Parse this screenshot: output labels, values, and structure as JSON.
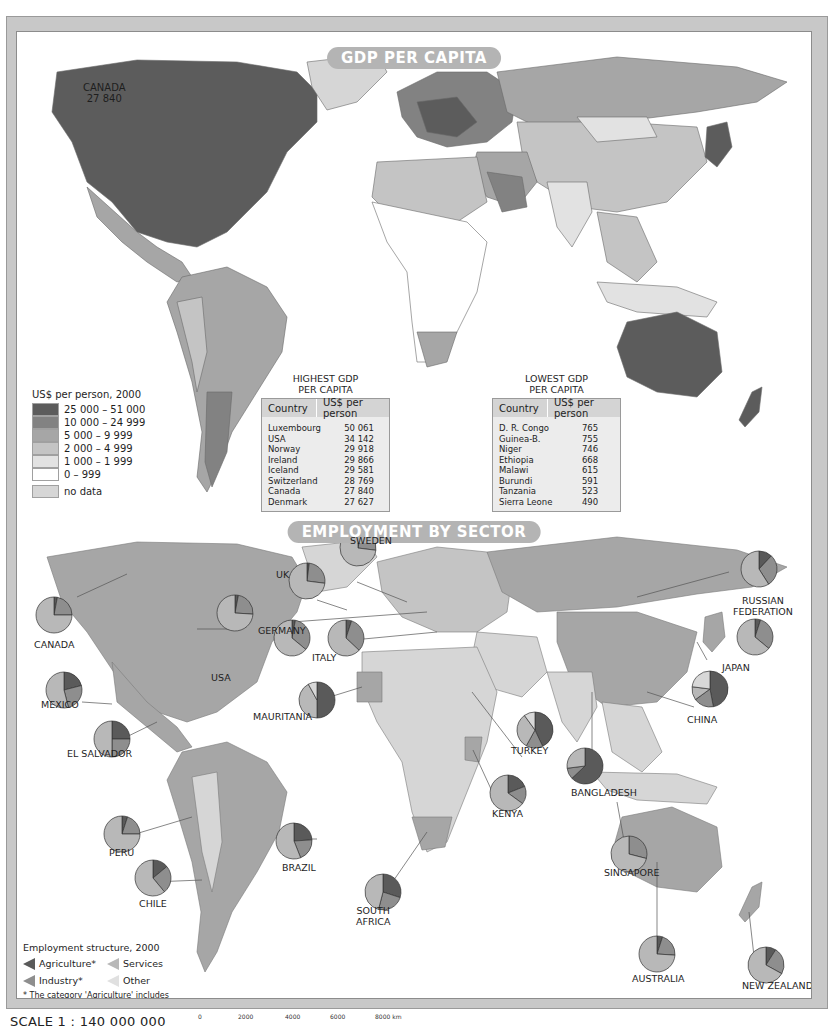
{
  "gdp_map": {
    "title": "GDP PER CAPITA",
    "callout": {
      "country": "CANADA",
      "value": "27 840"
    },
    "legend": {
      "title": "US$ per person, 2000",
      "classes": [
        {
          "label": "25 000 – 51 000",
          "color": "#5c5c5c"
        },
        {
          "label": "10 000 – 24 999",
          "color": "#828282"
        },
        {
          "label": "5 000 – 9 999",
          "color": "#a6a6a6"
        },
        {
          "label": "2 000 – 4 999",
          "color": "#c4c4c4"
        },
        {
          "label": "1 000 – 1 999",
          "color": "#e2e2e2"
        },
        {
          "label": "0 – 999",
          "color": "#ffffff"
        },
        {
          "label": "no data",
          "color": "#d6d6d6"
        }
      ]
    },
    "highest": {
      "heading_line1": "HIGHEST GDP",
      "heading_line2": "PER CAPITA",
      "col_country": "Country",
      "col_value": "US$ per person",
      "rows": [
        {
          "country": "Luxembourg",
          "value": "50 061"
        },
        {
          "country": "USA",
          "value": "34 142"
        },
        {
          "country": "Norway",
          "value": "29 918"
        },
        {
          "country": "Ireland",
          "value": "29 866"
        },
        {
          "country": "Iceland",
          "value": "29 581"
        },
        {
          "country": "Switzerland",
          "value": "28 769"
        },
        {
          "country": "Canada",
          "value": "27 840"
        },
        {
          "country": "Denmark",
          "value": "27 627"
        }
      ]
    },
    "lowest": {
      "heading_line1": "LOWEST GDP",
      "heading_line2": "PER CAPITA",
      "col_country": "Country",
      "col_value": "US$ per person",
      "rows": [
        {
          "country": "D. R. Congo",
          "value": "765"
        },
        {
          "country": "Guinea-B.",
          "value": "755"
        },
        {
          "country": "Niger",
          "value": "746"
        },
        {
          "country": "Ethiopia",
          "value": "668"
        },
        {
          "country": "Malawi",
          "value": "615"
        },
        {
          "country": "Burundi",
          "value": "591"
        },
        {
          "country": "Tanzania",
          "value": "523"
        },
        {
          "country": "Sierra Leone",
          "value": "490"
        }
      ]
    }
  },
  "employment_map": {
    "title": "EMPLOYMENT BY SECTOR",
    "legend": {
      "title": "Employment structure, 2000",
      "agriculture": "Agriculture*",
      "services": "Services",
      "industry": "Industry*",
      "other": "Other",
      "note": "* The category 'Agriculture' includes forestry and fishing. The category 'Industry' includes mining."
    },
    "sector_colors": {
      "agriculture": "#5a5a5a",
      "industry": "#8e8e8e",
      "services": "#b8b8b8",
      "other": "#d8d8d8"
    },
    "countries": [
      {
        "name": "CANADA",
        "label_lines": [
          "CANADA"
        ]
      },
      {
        "name": "USA",
        "label_lines": [
          "USA"
        ]
      },
      {
        "name": "UK",
        "label_lines": [
          "UK"
        ]
      },
      {
        "name": "SWEDEN",
        "label_lines": [
          "SWEDEN"
        ]
      },
      {
        "name": "GERMANY",
        "label_lines": [
          "GERMANY"
        ]
      },
      {
        "name": "ITALY",
        "label_lines": [
          "ITALY"
        ]
      },
      {
        "name": "RUSSIAN FEDERATION",
        "label_lines": [
          "RUSSIAN",
          "FEDERATION"
        ]
      },
      {
        "name": "JAPAN",
        "label_lines": [
          "JAPAN"
        ]
      },
      {
        "name": "CHINA",
        "label_lines": [
          "CHINA"
        ]
      },
      {
        "name": "MEXICO",
        "label_lines": [
          "MEXICO"
        ]
      },
      {
        "name": "EL SALVADOR",
        "label_lines": [
          "EL SALVADOR"
        ]
      },
      {
        "name": "MAURITANIA",
        "label_lines": [
          "MAURITANIA"
        ]
      },
      {
        "name": "TURKEY",
        "label_lines": [
          "TURKEY"
        ]
      },
      {
        "name": "BANGLADESH",
        "label_lines": [
          "BANGLADESH"
        ]
      },
      {
        "name": "KENYA",
        "label_lines": [
          "KENYA"
        ]
      },
      {
        "name": "PERU",
        "label_lines": [
          "PERU"
        ]
      },
      {
        "name": "BRAZIL",
        "label_lines": [
          "BRAZIL"
        ]
      },
      {
        "name": "CHILE",
        "label_lines": [
          "CHILE"
        ]
      },
      {
        "name": "SOUTH AFRICA",
        "label_lines": [
          "SOUTH",
          "AFRICA"
        ]
      },
      {
        "name": "SINGAPORE",
        "label_lines": [
          "SINGAPORE"
        ]
      },
      {
        "name": "AUSTRALIA",
        "label_lines": [
          "AUSTRALIA"
        ]
      },
      {
        "name": "NEW ZEALAND",
        "label_lines": [
          "NEW ZEALAND"
        ]
      }
    ]
  },
  "chart_data": [
    {
      "type": "table",
      "title": "HIGHEST GDP PER CAPITA",
      "columns": [
        "Country",
        "US$ per person"
      ],
      "categories": [
        "Luxembourg",
        "USA",
        "Norway",
        "Ireland",
        "Iceland",
        "Switzerland",
        "Canada",
        "Denmark"
      ],
      "values": [
        50061,
        34142,
        29918,
        29866,
        29581,
        28769,
        27840,
        27627
      ]
    },
    {
      "type": "table",
      "title": "LOWEST GDP PER CAPITA",
      "columns": [
        "Country",
        "US$ per person"
      ],
      "categories": [
        "D. R. Congo",
        "Guinea-B.",
        "Niger",
        "Ethiopia",
        "Malawi",
        "Burundi",
        "Tanzania",
        "Sierra Leone"
      ],
      "values": [
        765,
        755,
        746,
        668,
        615,
        591,
        523,
        490
      ]
    },
    {
      "type": "pie",
      "title": "Employment structure, 2000 (approximate shares, %)",
      "legend": [
        "Agriculture*",
        "Industry*",
        "Services",
        "Other"
      ],
      "series": [
        {
          "name": "CANADA",
          "values": [
            3,
            22,
            75,
            0
          ]
        },
        {
          "name": "USA",
          "values": [
            3,
            23,
            74,
            0
          ]
        },
        {
          "name": "UK",
          "values": [
            2,
            25,
            73,
            0
          ]
        },
        {
          "name": "SWEDEN",
          "values": [
            3,
            24,
            73,
            0
          ]
        },
        {
          "name": "GERMANY",
          "values": [
            3,
            33,
            64,
            0
          ]
        },
        {
          "name": "ITALY",
          "values": [
            5,
            32,
            63,
            0
          ]
        },
        {
          "name": "RUSSIAN FEDERATION",
          "values": [
            12,
            29,
            59,
            0
          ]
        },
        {
          "name": "JAPAN",
          "values": [
            5,
            31,
            64,
            0
          ]
        },
        {
          "name": "CHINA",
          "values": [
            47,
            18,
            12,
            23
          ]
        },
        {
          "name": "MEXICO",
          "values": [
            21,
            25,
            54,
            0
          ]
        },
        {
          "name": "EL SALVADOR",
          "values": [
            25,
            25,
            50,
            0
          ]
        },
        {
          "name": "MAURITANIA",
          "values": [
            50,
            0,
            42,
            8
          ]
        },
        {
          "name": "TURKEY",
          "values": [
            43,
            15,
            32,
            10
          ]
        },
        {
          "name": "BANGLADESH",
          "values": [
            63,
            10,
            27,
            0
          ]
        },
        {
          "name": "KENYA",
          "values": [
            19,
            16,
            65,
            0
          ]
        },
        {
          "name": "PERU",
          "values": [
            5,
            20,
            75,
            0
          ]
        },
        {
          "name": "BRAZIL",
          "values": [
            24,
            20,
            56,
            0
          ]
        },
        {
          "name": "CHILE",
          "values": [
            14,
            25,
            61,
            0
          ]
        },
        {
          "name": "SOUTH AFRICA",
          "values": [
            30,
            24,
            46,
            0
          ]
        },
        {
          "name": "SINGAPORE",
          "values": [
            0,
            29,
            71,
            0
          ]
        },
        {
          "name": "AUSTRALIA",
          "values": [
            5,
            21,
            74,
            0
          ]
        },
        {
          "name": "NEW ZEALAND",
          "values": [
            9,
            24,
            67,
            0
          ]
        }
      ]
    }
  ],
  "scale_bar": {
    "title": "SCALE 1 : 140 000 000",
    "ticks": [
      "0",
      "2000",
      "4000",
      "6000",
      "8000 km"
    ]
  }
}
